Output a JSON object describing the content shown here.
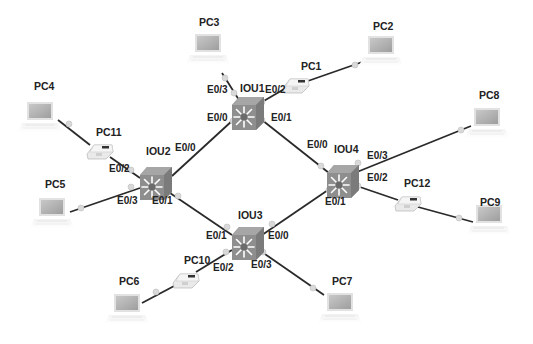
{
  "diagram": {
    "colors": {
      "switch_body": "#8d8d8d",
      "switch_top": "#a9a9a9",
      "switch_star": "#ffffff",
      "switch_center": "#6e6e6e",
      "link": "#2a2a2a",
      "endpoint_dot": "#d9d9d9",
      "laptop_screen": "#b3b3b3",
      "laptop_base": "#efefef",
      "phone": "#e6e6e6"
    },
    "switches": [
      {
        "id": "IOU1",
        "label": "IOU1",
        "x": 247,
        "y": 113
      },
      {
        "id": "IOU2",
        "label": "IOU2",
        "x": 155,
        "y": 183
      },
      {
        "id": "IOU3",
        "label": "IOU3",
        "x": 247,
        "y": 243
      },
      {
        "id": "IOU4",
        "label": "IOU4",
        "x": 342,
        "y": 181
      }
    ],
    "laptops": [
      {
        "id": "PC2",
        "label": "PC2",
        "x": 381,
        "y": 44
      },
      {
        "id": "PC3",
        "label": "PC3",
        "x": 208,
        "y": 42
      },
      {
        "id": "PC4",
        "label": "PC4",
        "x": 40,
        "y": 110
      },
      {
        "id": "PC5",
        "label": "PC5",
        "x": 52,
        "y": 206
      },
      {
        "id": "PC6",
        "label": "PC6",
        "x": 127,
        "y": 302
      },
      {
        "id": "PC7",
        "label": "PC7",
        "x": 340,
        "y": 302
      },
      {
        "id": "PC8",
        "label": "PC8",
        "x": 487,
        "y": 117
      },
      {
        "id": "PC9",
        "label": "PC9",
        "x": 489,
        "y": 214
      }
    ],
    "phones": [
      {
        "id": "PC1",
        "label": "PC1",
        "x": 296,
        "y": 84
      },
      {
        "id": "PC11",
        "label": "PC11",
        "x": 100,
        "y": 149
      },
      {
        "id": "PC12",
        "label": "PC12",
        "x": 408,
        "y": 202
      },
      {
        "id": "PC10",
        "label": "PC10",
        "x": 185,
        "y": 278
      }
    ],
    "links": [
      {
        "from": "IOU1",
        "to": "PC3",
        "port": "E0/3"
      },
      {
        "from": "IOU1",
        "to": "PC1",
        "port": "E0/2"
      },
      {
        "from": "PC1",
        "to": "PC2",
        "port": ""
      },
      {
        "from": "IOU1",
        "to": "IOU2",
        "port_a": "E0/0",
        "port_b": "E0/0"
      },
      {
        "from": "IOU1",
        "to": "IOU4",
        "port_a": "E0/1",
        "port_b": "E0/0"
      },
      {
        "from": "IOU2",
        "to": "PC11",
        "port": "E0/2"
      },
      {
        "from": "PC11",
        "to": "PC4",
        "port": ""
      },
      {
        "from": "IOU2",
        "to": "PC5",
        "port": "E0/3"
      },
      {
        "from": "IOU2",
        "to": "IOU3",
        "port_a": "E0/1",
        "port_b": "E0/1"
      },
      {
        "from": "IOU4",
        "to": "IOU3",
        "port_a": "E0/1",
        "port_b": "E0/0"
      },
      {
        "from": "IOU4",
        "to": "PC8",
        "port": "E0/3"
      },
      {
        "from": "IOU4",
        "to": "PC12",
        "port": "E0/2"
      },
      {
        "from": "PC12",
        "to": "PC9",
        "port": ""
      },
      {
        "from": "IOU3",
        "to": "PC10",
        "port": "E0/2"
      },
      {
        "from": "PC10",
        "to": "PC6",
        "port": ""
      },
      {
        "from": "IOU3",
        "to": "PC7",
        "port": "E0/3"
      }
    ],
    "port_labels": {
      "iou1_e03": "E0/3",
      "iou1_e02": "E0/2",
      "iou1_e00": "E0/0",
      "iou1_e01": "E0/1",
      "iou2_e00": "E0/0",
      "iou2_e02": "E0/2",
      "iou2_e03": "E0/3",
      "iou2_e01": "E0/1",
      "iou3_e01": "E0/1",
      "iou3_e00": "E0/0",
      "iou3_e02": "E0/2",
      "iou3_e03": "E0/3",
      "iou4_e00": "E0/0",
      "iou4_e03": "E0/3",
      "iou4_e02": "E0/2",
      "iou4_e01": "E0/1"
    },
    "device_labels": {
      "IOU1": "IOU1",
      "IOU2": "IOU2",
      "IOU3": "IOU3",
      "IOU4": "IOU4",
      "PC1": "PC1",
      "PC2": "PC2",
      "PC3": "PC3",
      "PC4": "PC4",
      "PC5": "PC5",
      "PC6": "PC6",
      "PC7": "PC7",
      "PC8": "PC8",
      "PC9": "PC9",
      "PC10": "PC10",
      "PC11": "PC11",
      "PC12": "PC12"
    }
  }
}
